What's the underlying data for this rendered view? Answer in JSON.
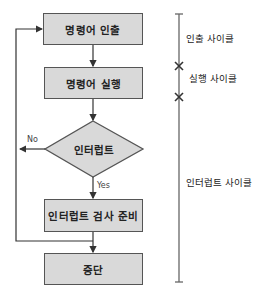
{
  "flowchart": {
    "steps": [
      {
        "id": "fetch",
        "label": "명령어 인출"
      },
      {
        "id": "execute",
        "label": "명령어 실행"
      },
      {
        "id": "interrupt",
        "label": "인터럽트",
        "shape": "diamond"
      },
      {
        "id": "prepare",
        "label": "인터럽트 검사 준비"
      },
      {
        "id": "halt",
        "label": "중단"
      }
    ],
    "branches": {
      "no": "No",
      "yes": "Yes"
    }
  },
  "timeline": {
    "cycles": [
      {
        "label": "인출 사이클"
      },
      {
        "label": "실행 사이클"
      },
      {
        "label": "인터럽트 사이클"
      }
    ]
  },
  "colors": {
    "box_fill": "#d9d9d9",
    "stroke": "#555555"
  }
}
